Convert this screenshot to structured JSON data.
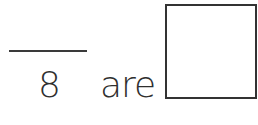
{
  "fraction": {
    "numerator": "",
    "denominator": "8"
  },
  "word": "are",
  "answer_box": {
    "value": ""
  }
}
